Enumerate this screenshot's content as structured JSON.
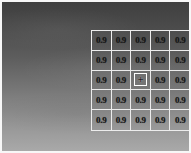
{
  "figure": {
    "description_colors": {
      "background_top": "#3f3f3f",
      "background_bottom": "#a9a9a9",
      "frame": "#f7f7f7",
      "grid_line": "#ececec",
      "cell_text": "#151515",
      "marker_box": "#ffffff"
    },
    "grid": {
      "rows": 5,
      "cols": 5,
      "values": [
        [
          "0.9",
          "0.9",
          "0.9",
          "0.9",
          "0.9"
        ],
        [
          "0.9",
          "0.9",
          "0.9",
          "0.9",
          "0.9"
        ],
        [
          "0.9",
          "0.9",
          "",
          "0.9",
          "0.9"
        ],
        [
          "0.9",
          "0.9",
          "0.9",
          "0.9",
          "0.9"
        ],
        [
          "0.9",
          "0.9",
          "0.9",
          "0.9",
          "0.9"
        ]
      ],
      "marker": {
        "row": 2,
        "col": 2,
        "symbol": "+"
      }
    }
  }
}
